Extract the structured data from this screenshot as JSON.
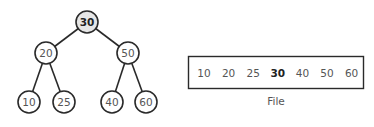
{
  "tree": {
    "nodes": [
      {
        "id": "n30",
        "label": "30",
        "x": 87,
        "y": 22,
        "highlight": true
      },
      {
        "id": "n20",
        "label": "20",
        "x": 46,
        "y": 53,
        "highlight": false
      },
      {
        "id": "n50",
        "label": "50",
        "x": 128,
        "y": 53,
        "highlight": false
      },
      {
        "id": "n10",
        "label": "10",
        "x": 29,
        "y": 102,
        "highlight": false
      },
      {
        "id": "n25",
        "label": "25",
        "x": 64,
        "y": 102,
        "highlight": false
      },
      {
        "id": "n40",
        "label": "40",
        "x": 112,
        "y": 102,
        "highlight": false
      },
      {
        "id": "n60",
        "label": "60",
        "x": 146,
        "y": 102,
        "highlight": false
      }
    ],
    "edges": [
      [
        "n30",
        "n20"
      ],
      [
        "n30",
        "n50"
      ],
      [
        "n20",
        "n10"
      ],
      [
        "n20",
        "n25"
      ],
      [
        "n50",
        "n40"
      ],
      [
        "n50",
        "n60"
      ]
    ],
    "node_radius": 11,
    "highlight_fill": "#e6e6e6"
  },
  "file": {
    "items": [
      {
        "label": "10",
        "bold": false
      },
      {
        "label": "20",
        "bold": false
      },
      {
        "label": "25",
        "bold": false
      },
      {
        "label": "30",
        "bold": true
      },
      {
        "label": "40",
        "bold": false
      },
      {
        "label": "50",
        "bold": false
      },
      {
        "label": "60",
        "bold": false
      }
    ],
    "caption": "File"
  }
}
